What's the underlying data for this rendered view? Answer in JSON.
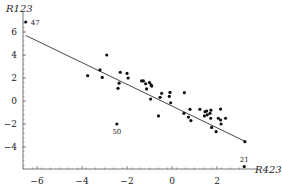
{
  "chart_data": {
    "type": "scatter",
    "title": "",
    "xlabel": "R423",
    "ylabel": "R123",
    "xlim": [
      -6.7,
      3.5
    ],
    "ylim": [
      -5.9,
      7.2
    ],
    "xticks": [
      -6,
      -4,
      -2,
      0,
      2
    ],
    "yticks": [
      -4,
      -2,
      0,
      2,
      4,
      6
    ],
    "grid": false,
    "legend": null,
    "regression_line": {
      "x": [
        -6.5,
        3.24
      ],
      "y": [
        5.7,
        -3.5
      ]
    },
    "annotations": [
      {
        "label": "47",
        "x": -6.5,
        "y": 6.87
      },
      {
        "label": "50",
        "x": -2.45,
        "y": -2.0
      },
      {
        "label": "21",
        "x": 3.21,
        "y": -5.7
      }
    ],
    "points": [
      {
        "x": -6.5,
        "y": 6.87
      },
      {
        "x": -2.45,
        "y": -2.0
      },
      {
        "x": 3.21,
        "y": -5.7
      },
      {
        "x": 3.24,
        "y": -3.54
      },
      {
        "x": -2.9,
        "y": 4.0
      },
      {
        "x": -3.2,
        "y": 2.7
      },
      {
        "x": -3.75,
        "y": 2.2
      },
      {
        "x": -3.1,
        "y": 2.05
      },
      {
        "x": -2.3,
        "y": 2.5
      },
      {
        "x": -2.0,
        "y": 2.4
      },
      {
        "x": -1.95,
        "y": 2.0
      },
      {
        "x": -2.35,
        "y": 1.55
      },
      {
        "x": -2.4,
        "y": 1.1
      },
      {
        "x": -1.35,
        "y": 1.75
      },
      {
        "x": -1.27,
        "y": 1.75
      },
      {
        "x": -1.17,
        "y": 1.5
      },
      {
        "x": -1.0,
        "y": 1.6
      },
      {
        "x": -0.93,
        "y": 1.4
      },
      {
        "x": -1.13,
        "y": 1.05
      },
      {
        "x": -0.9,
        "y": 1.3
      },
      {
        "x": -0.95,
        "y": 0.17
      },
      {
        "x": -0.46,
        "y": 0.67
      },
      {
        "x": -0.53,
        "y": 0.32
      },
      {
        "x": -0.09,
        "y": 0.75
      },
      {
        "x": -0.12,
        "y": 0.4
      },
      {
        "x": -0.06,
        "y": -0.15
      },
      {
        "x": -0.6,
        "y": -1.3
      },
      {
        "x": 0.55,
        "y": 0.72
      },
      {
        "x": 0.8,
        "y": -0.72
      },
      {
        "x": 0.53,
        "y": -1.07
      },
      {
        "x": 0.73,
        "y": -1.4
      },
      {
        "x": 0.84,
        "y": -1.7
      },
      {
        "x": 1.24,
        "y": -0.72
      },
      {
        "x": 1.47,
        "y": -0.93
      },
      {
        "x": 1.54,
        "y": -0.87
      },
      {
        "x": 1.44,
        "y": -1.3
      },
      {
        "x": 1.57,
        "y": -1.2
      },
      {
        "x": 1.69,
        "y": -1.07
      },
      {
        "x": 1.73,
        "y": -0.8
      },
      {
        "x": 1.72,
        "y": -1.5
      },
      {
        "x": 1.76,
        "y": -2.3
      },
      {
        "x": 2.16,
        "y": -0.7
      },
      {
        "x": 2.06,
        "y": -1.5
      },
      {
        "x": 2.16,
        "y": -1.65
      },
      {
        "x": 2.38,
        "y": -1.5
      },
      {
        "x": 2.18,
        "y": -2.0
      },
      {
        "x": 1.96,
        "y": -2.67
      }
    ]
  },
  "style": {
    "point_color": "#111111",
    "line_color": "#333333",
    "axis_color": "#555555"
  },
  "layout": {
    "x0_px": 172,
    "x_scale": 22.5,
    "y0_px": 101,
    "y_scale": 11.5,
    "axis_x_left": 23,
    "axis_x_right": 258,
    "axis_y_bottom": 169,
    "axis_y_top": 12
  }
}
